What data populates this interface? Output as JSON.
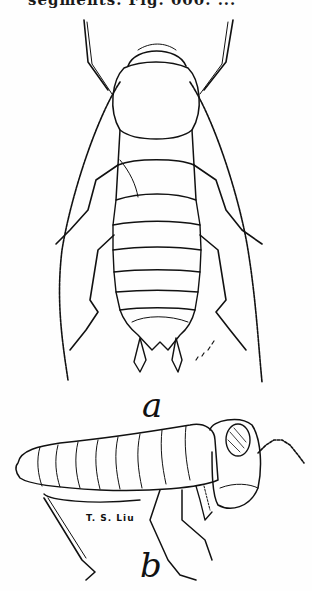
{
  "page": {
    "header_text": "segments. Fig. 000. ...",
    "figure": {
      "subject": "insect nymph illustration",
      "panels": [
        {
          "label": "a",
          "view": "dorsal view"
        },
        {
          "label": "b",
          "view": "lateral view"
        }
      ],
      "artist_signature": "T. S. Liu"
    }
  }
}
